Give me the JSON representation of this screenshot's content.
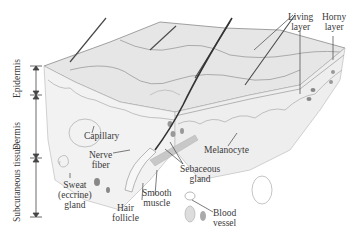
{
  "diagram": {
    "layers_scale": [
      {
        "name": "epidermis",
        "label": "Epidermis"
      },
      {
        "name": "dermis",
        "label": "Dermis"
      },
      {
        "name": "subcutaneous",
        "label": "Subcutaneous tissue"
      }
    ],
    "labels": {
      "living_layer": [
        "Living",
        "layer"
      ],
      "horny_layer": [
        "Horny",
        "layer"
      ],
      "capillary": "Capillary",
      "nerve_fiber": [
        "Nerve",
        "fiber"
      ],
      "melanocyte": "Melanocyte",
      "sebaceous_gland": [
        "Sebaceous",
        "gland"
      ],
      "sweat_gland": [
        "Sweat",
        "(eccrine)",
        "gland"
      ],
      "smooth_muscle": [
        "Smooth",
        "muscle"
      ],
      "hair_follicle": [
        "Hair",
        "follicle"
      ],
      "blood_vessel": [
        "Blood",
        "vessel"
      ]
    },
    "colors": {
      "ink": "#3a3a3a",
      "skin_surface": "#e4e4e4",
      "shadow": "#9a9a9a",
      "hair": "#4a4a4a"
    }
  }
}
